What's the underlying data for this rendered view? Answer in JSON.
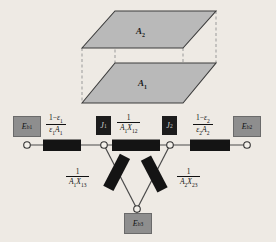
{
  "figure": {
    "type": "radiation-network-diagram",
    "geometry": {
      "plates": [
        {
          "name": "top-plate",
          "label": "A",
          "subscript": "2"
        },
        {
          "name": "bottom-plate",
          "label": "A",
          "subscript": "1"
        }
      ],
      "fill_color": "#b9b9b9",
      "edge_color": "#3c3c3c",
      "dashed_edge_color": "#8a8a8a"
    }
  },
  "network": {
    "nodes": {
      "eb1": {
        "label": "E",
        "subscript": "b1",
        "kind": "surface-potential"
      },
      "eb2": {
        "label": "E",
        "subscript": "b2",
        "kind": "surface-potential"
      },
      "eb3": {
        "label": "E",
        "subscript": "b3",
        "kind": "surface-potential"
      },
      "j1": {
        "label": "J",
        "subscript": "1",
        "kind": "radiosity"
      },
      "j2": {
        "label": "J",
        "subscript": "2",
        "kind": "radiosity"
      }
    },
    "resistors": [
      {
        "name": "surface-resistance-1",
        "num_prefix": "1",
        "num_minus": "−",
        "num_eps": "ε",
        "num_eps_sub": "1",
        "den_eps": "ε",
        "den_eps_sub": "1",
        "den_area": "A",
        "den_area_sub": "1",
        "expression": "(1−ε₁)/(ε₁A₁)"
      },
      {
        "name": "space-resistance-12",
        "num": "1",
        "den_area": "A",
        "den_area_sub": "1",
        "den_x": "X",
        "den_x_sub": "12",
        "expression": "1/(A₁X₁₂)"
      },
      {
        "name": "surface-resistance-2",
        "num_prefix": "1",
        "num_minus": "−",
        "num_eps": "ε",
        "num_eps_sub": "2",
        "den_eps": "ε",
        "den_eps_sub": "2",
        "den_area": "A",
        "den_area_sub": "2",
        "expression": "(1−ε₂)/(ε₂A₂)"
      },
      {
        "name": "space-resistance-13",
        "num": "1",
        "den_area": "A",
        "den_area_sub": "1",
        "den_x": "X",
        "den_x_sub": "13",
        "expression": "1/(A₁X₁₃)"
      },
      {
        "name": "space-resistance-23",
        "num": "1",
        "den_area": "A",
        "den_area_sub": "2",
        "den_x": "X",
        "den_x_sub": "23",
        "expression": "1/(A₂X₂₃)"
      }
    ],
    "colors": {
      "resistor_body": "#141414",
      "wire": "#4a4a4a",
      "terminal_fill": "#f2efe9",
      "potential_box": "#8e8e8e",
      "radiosity_box": "#1c1c1c"
    }
  }
}
